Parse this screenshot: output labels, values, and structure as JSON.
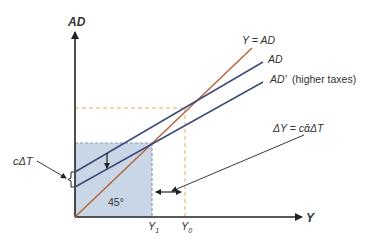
{
  "diagram": {
    "axes": {
      "y_label": "AD",
      "x_label": "Y"
    },
    "lines": {
      "forty_five": {
        "label": "Y = AD",
        "color": "#b5653a"
      },
      "ad": {
        "label": "AD",
        "color": "#3f4a7a"
      },
      "ad_prime": {
        "label": "AD'",
        "note": "(higher taxes)",
        "color": "#3f4a7a"
      }
    },
    "angle_label": "45°",
    "shift_label": "cΔT",
    "multiplier_label": "ΔY = cᾱΔT",
    "x_ticks": {
      "y1": "Y",
      "y1_sub": "1",
      "y0": "Y",
      "y0_sub": "0"
    },
    "colors": {
      "shaded_box": "#c9d6e6",
      "box_dash": "#8a9bb5",
      "guide_dash": "#e3b25a",
      "axis": "#222222"
    }
  }
}
